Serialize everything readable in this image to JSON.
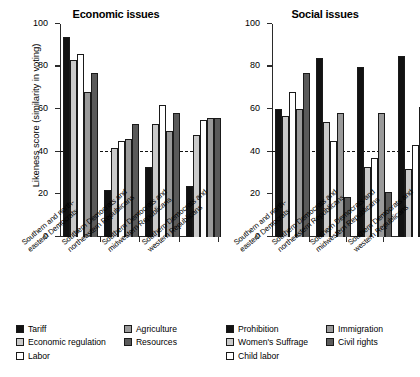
{
  "figure": {
    "ylabel": "Likeness score (similarity in voting)",
    "yticks": [
      0,
      20,
      40,
      60,
      80,
      100
    ],
    "reference_line": 40
  },
  "categories": [
    {
      "line1": "Southern and north-",
      "line2": "eastern Democrats"
    },
    {
      "line1": "Southern Democrats and",
      "line2": "northeastern Republicans"
    },
    {
      "line1": "Southern Democrats and",
      "line2": "midwestern Republicans"
    },
    {
      "line1": "Southern Democrats and",
      "line2": "western Republicans"
    }
  ],
  "legend_left": [
    {
      "label": "Tariff",
      "swatch": "sw-black"
    },
    {
      "label": "Economic regulation",
      "swatch": "sw-lgray"
    },
    {
      "label": "Labor",
      "swatch": "sw-white"
    },
    {
      "label": "Agriculture",
      "swatch": "sw-mgray"
    },
    {
      "label": "Resources",
      "swatch": "sw-dgray"
    }
  ],
  "legend_right": [
    {
      "label": "Prohibition",
      "swatch": "sw-black"
    },
    {
      "label": "Women's Suffrage",
      "swatch": "sw-lgray"
    },
    {
      "label": "Child labor",
      "swatch": "sw-white"
    },
    {
      "label": "Immigration",
      "swatch": "sw-mgray"
    },
    {
      "label": "Civil rights",
      "swatch": "sw-dgray"
    }
  ],
  "chart_data": [
    {
      "type": "bar",
      "title": "Economic issues",
      "xlabel": "",
      "ylabel": "Likeness score (similarity in voting)",
      "ylim": [
        0,
        100
      ],
      "yticks": [
        0,
        20,
        40,
        60,
        80,
        100
      ],
      "grid": false,
      "legend_position": "below-left",
      "reference_line": 40,
      "categories": [
        "Southern and northeastern Democrats",
        "Southern Democrats and northeastern Republicans",
        "Southern Democrats and midwestern Republicans",
        "Southern Democrats and western Republicans"
      ],
      "series": [
        {
          "name": "Tariff",
          "color": "#121212",
          "values": [
            94,
            22,
            33,
            24
          ]
        },
        {
          "name": "Economic regulation",
          "color": "#cacaca",
          "values": [
            83,
            42,
            53,
            48
          ]
        },
        {
          "name": "Labor",
          "color": "#ffffff",
          "values": [
            86,
            45,
            62,
            55
          ]
        },
        {
          "name": "Agriculture",
          "color": "#9a9a9a",
          "values": [
            68,
            46,
            50,
            56
          ]
        },
        {
          "name": "Resources",
          "color": "#5a5a5a",
          "values": [
            77,
            53,
            58,
            56
          ]
        }
      ]
    },
    {
      "type": "bar",
      "title": "Social issues",
      "xlabel": "",
      "ylabel": "Likeness score (similarity in voting)",
      "ylim": [
        0,
        100
      ],
      "yticks": [
        0,
        20,
        40,
        60,
        80,
        100
      ],
      "grid": false,
      "legend_position": "below-right",
      "reference_line": 40,
      "categories": [
        "Southern and northeastern Democrats",
        "Southern Democrats and northeastern Republicans",
        "Southern Democrats and midwestern Republicans",
        "Southern Democrats and western Republicans"
      ],
      "series": [
        {
          "name": "Prohibition",
          "color": "#121212",
          "values": [
            60,
            84,
            80,
            85
          ]
        },
        {
          "name": "Women's Suffrage",
          "color": "#cacaca",
          "values": [
            57,
            54,
            33,
            32
          ]
        },
        {
          "name": "Child labor",
          "color": "#ffffff",
          "values": [
            68,
            45,
            37,
            43
          ]
        },
        {
          "name": "Immigration",
          "color": "#9a9a9a",
          "values": [
            60,
            58,
            58,
            61
          ]
        },
        {
          "name": "Civil rights",
          "color": "#5a5a5a",
          "values": [
            77,
            19,
            21,
            26
          ]
        }
      ]
    }
  ]
}
